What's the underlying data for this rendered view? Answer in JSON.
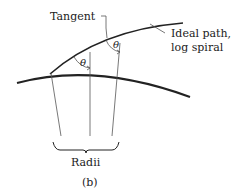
{
  "diagram": {
    "labels": {
      "tangent": "Tangent",
      "ideal_path_line1": "Ideal path,",
      "ideal_path_line2": "log spiral",
      "theta1": "θ",
      "theta2": "θ",
      "radii": "Radii",
      "caption": "(b)"
    },
    "colors": {
      "stroke": "#222222",
      "thin_stroke": "#555555",
      "background": "#ffffff"
    }
  }
}
